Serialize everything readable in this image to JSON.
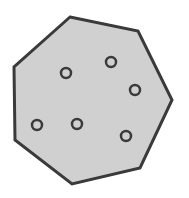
{
  "diagram": {
    "shape": "heptagon",
    "fill": "#d0d0d0",
    "stroke": "#3a3a3a",
    "stroke_width": 3,
    "vertices": [
      [
        70,
        17
      ],
      [
        138,
        31
      ],
      [
        172,
        100
      ],
      [
        140,
        168
      ],
      [
        72,
        184
      ],
      [
        15,
        140
      ],
      [
        14,
        67
      ]
    ],
    "points": {
      "count": 6,
      "radius": 5,
      "stroke": "#3a3a3a",
      "fill": "#d0d0d0",
      "items": [
        [
          66,
          73
        ],
        [
          111,
          62
        ],
        [
          135,
          90
        ],
        [
          37,
          125
        ],
        [
          77,
          124
        ],
        [
          126,
          136
        ]
      ]
    }
  }
}
